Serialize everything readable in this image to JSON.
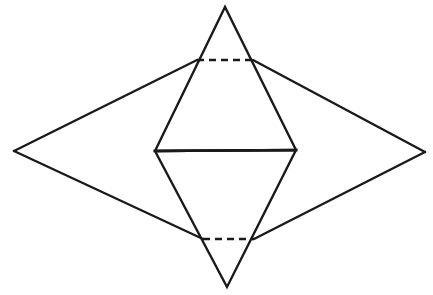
{
  "figure": {
    "type": "geometric-line-diagram",
    "background_color": "#ffffff",
    "line_color": "#1a1a1a",
    "solid_stroke_width": 2.4,
    "dashed_stroke_width": 2.6,
    "dash_pattern": "7 5",
    "canvas": {
      "width": 433,
      "height": 295
    }
  },
  "points": {
    "top_apex": {
      "x": 225,
      "y": 7,
      "label": "top apex of upper triangle"
    },
    "bottom_apex": {
      "x": 227,
      "y": 287,
      "label": "bottom apex of lower triangle"
    },
    "left_vertex": {
      "x": 14,
      "y": 151,
      "label": "left vertex of outer kite"
    },
    "right_vertex": {
      "x": 425,
      "y": 152,
      "label": "right vertex of outer kite"
    },
    "inner_left": {
      "x": 155,
      "y": 151,
      "label": "left end of inner horizontal chord"
    },
    "inner_right": {
      "x": 296,
      "y": 150,
      "label": "right end of inner horizontal chord"
    },
    "upper_dash_left": {
      "x": 197,
      "y": 60,
      "label": "left end of upper dashed chord"
    },
    "upper_dash_right": {
      "x": 253,
      "y": 60,
      "label": "right end of upper dashed chord"
    },
    "lower_dash_left": {
      "x": 203,
      "y": 239,
      "label": "left end of lower dashed chord"
    },
    "lower_dash_right": {
      "x": 254,
      "y": 239,
      "label": "right end of lower dashed chord"
    }
  },
  "shapes": {
    "upper_triangle": {
      "name": "upper-triangle",
      "style": "solid",
      "points": "225,7 155,151 296,150"
    },
    "lower_triangle": {
      "name": "lower-triangle",
      "style": "solid",
      "points": "155,151 296,150 227,287"
    },
    "inner_chord": {
      "name": "inner-horizontal-chord",
      "style": "solid",
      "d": "M155,151 L296,150"
    },
    "outer_kite_upper_left": {
      "name": "outer-kite-upper-left-edge",
      "style": "solid",
      "d": "M14,151 L197,60"
    },
    "outer_kite_upper_right": {
      "name": "outer-kite-upper-right-edge",
      "style": "solid",
      "d": "M253,60 L425,152"
    },
    "outer_kite_lower_right": {
      "name": "outer-kite-lower-right-edge",
      "style": "solid",
      "d": "M425,152 L254,239"
    },
    "outer_kite_lower_left": {
      "name": "outer-kite-lower-left-edge",
      "style": "solid",
      "d": "M203,239 L14,151"
    },
    "upper_dashed_chord": {
      "name": "upper-dashed-chord",
      "style": "dashed",
      "d": "M197,60 L253,60"
    },
    "lower_dashed_chord": {
      "name": "lower-dashed-chord",
      "style": "dashed",
      "d": "M203,239 L254,239"
    }
  }
}
